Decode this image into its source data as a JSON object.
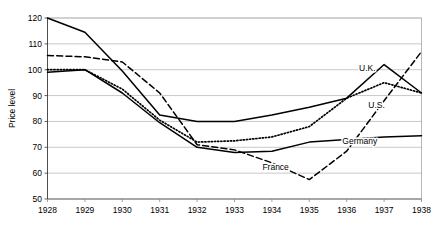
{
  "chart_data": {
    "type": "line",
    "title": "",
    "xlabel": "",
    "ylabel": "Price level",
    "x": [
      1928,
      1929,
      1930,
      1931,
      1932,
      1933,
      1934,
      1935,
      1936,
      1937,
      1938
    ],
    "categories": [
      "1928",
      "1929",
      "1930",
      "1931",
      "1932",
      "1933",
      "1934",
      "1935",
      "1936",
      "1937",
      "1938"
    ],
    "xlim": [
      1928,
      1938
    ],
    "ylim": [
      50,
      120
    ],
    "yticks": [
      50,
      60,
      70,
      80,
      90,
      100,
      110,
      120
    ],
    "ytick_labels": [
      "50",
      "60",
      "70",
      "80",
      "90",
      "100",
      "110",
      "120"
    ],
    "grid": "horizontal",
    "legend_position": "inline-labels",
    "series": [
      {
        "name": "U.K.",
        "style": "solid",
        "color": "#000000",
        "values": [
          120,
          114.5,
          99.5,
          82.5,
          80,
          80,
          82.5,
          85.5,
          89,
          102,
          91
        ],
        "label": "U.K.",
        "label_x": 1936.55,
        "label_y": 100.5
      },
      {
        "name": "U.S.",
        "style": "dotted",
        "color": "#000000",
        "values": [
          100,
          100,
          92.5,
          80.5,
          72,
          72.5,
          74,
          78,
          89,
          95,
          91
        ],
        "label": "U.S.",
        "label_x": 1936.8,
        "label_y": 86.5
      },
      {
        "name": "Germany",
        "style": "solid",
        "color": "#000000",
        "values": [
          99,
          100,
          91,
          79.5,
          70,
          68,
          68.5,
          72,
          73,
          74,
          74.5
        ],
        "label": "Germany",
        "label_x": 1936.35,
        "label_y": 72.5
      },
      {
        "name": "France",
        "style": "dashed",
        "color": "#000000",
        "values": [
          105.5,
          105,
          103,
          91,
          71,
          69,
          64,
          57.5,
          68.5,
          88,
          107
        ],
        "label": "France",
        "label_x": 1934.1,
        "label_y": 62.5
      }
    ]
  }
}
